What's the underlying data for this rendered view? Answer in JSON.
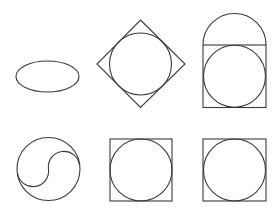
{
  "canvas": {
    "width": 275,
    "height": 210,
    "background": "#ffffff",
    "stroke_color": "#3a3a3a"
  },
  "figures": [
    {
      "id": "a",
      "name": "ellipse",
      "description": "horizontal ellipse",
      "ellipse": {
        "cx": 47.5,
        "cy": 76.5,
        "rx": 31.5,
        "ry": 15.5
      }
    },
    {
      "id": "b",
      "name": "circle-in-diamond",
      "description": "circle inscribed in a rotated square (diamond)",
      "diamond": {
        "top": [
          140.5,
          20
        ],
        "right": [
          185,
          64
        ],
        "bottom": [
          140.5,
          107.5
        ],
        "left": [
          97,
          64
        ]
      },
      "circle": {
        "cx": 140.5,
        "cy": 64,
        "r": 31
      }
    },
    {
      "id": "c",
      "name": "circle-in-square-with-semicircle-cap",
      "description": "circle inscribed in a square with a semicircle on top",
      "square": {
        "x": 203,
        "y": 45,
        "w": 63,
        "h": 62.5
      },
      "semicircle": {
        "cx": 234.5,
        "cy": 45,
        "r": 31.5
      },
      "circle": {
        "cx": 234.5,
        "cy": 76.25,
        "r": 31
      }
    },
    {
      "id": "d",
      "name": "yin-yang-circle",
      "description": "circle divided by an S-curve",
      "circle": {
        "cx": 48.5,
        "cy": 169,
        "r": 31.5
      },
      "s_curve": "M 79.5 165 A 15.5 15.5 0 0 0 48.5 169 A 15.5 15.5 0 0 1 17.5 173"
    },
    {
      "id": "e",
      "name": "circle-in-square",
      "description": "circle inscribed in a square",
      "square": {
        "x": 110,
        "y": 139,
        "w": 62,
        "h": 62
      },
      "circle": {
        "cx": 141,
        "cy": 170,
        "r": 31
      }
    },
    {
      "id": "f",
      "name": "circle-in-square",
      "description": "circle inscribed in a square",
      "square": {
        "x": 203,
        "y": 139,
        "w": 63,
        "h": 62
      },
      "circle": {
        "cx": 234.5,
        "cy": 170,
        "r": 31
      }
    }
  ]
}
